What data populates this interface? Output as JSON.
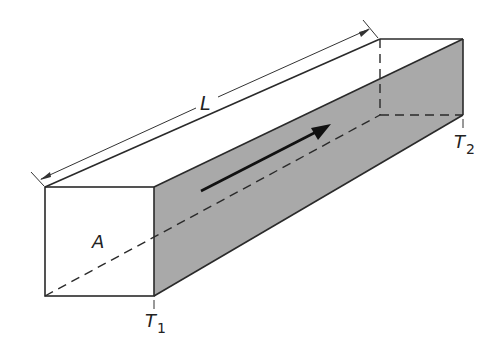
{
  "diagram": {
    "type": "rectangular bar heat conduction",
    "labels": {
      "length": "L",
      "area": "A",
      "temp1": "T",
      "temp1_sub": "1",
      "temp2": "T",
      "temp2_sub": "2"
    },
    "colors": {
      "shaded_face": "#a9a9a9",
      "line": "#2a2a2a",
      "background": "#ffffff"
    },
    "arrow": {
      "direction": "from T1 end toward T2 end",
      "meaning": "heat flow"
    }
  }
}
